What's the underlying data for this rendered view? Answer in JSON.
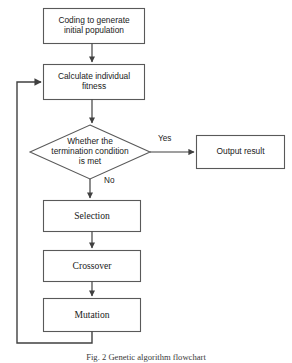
{
  "diagram": {
    "title": "Genetic algorithm flowchart",
    "colors": {
      "stroke": "#595959",
      "stroke_dark": "#404040",
      "text": "#1a1a1a",
      "background": "#ffffff"
    },
    "nodes": [
      {
        "id": "coding",
        "shape": "process",
        "label": "Coding to generate\ninitial population",
        "font": "sans"
      },
      {
        "id": "calculate",
        "shape": "process",
        "label": "Calculate individual\nfitness",
        "font": "sans"
      },
      {
        "id": "termination",
        "shape": "decision",
        "label": "Whether the\ntermination condition\nis met",
        "font": "sans"
      },
      {
        "id": "output",
        "shape": "process",
        "label": "Output result",
        "font": "sans"
      },
      {
        "id": "selection",
        "shape": "process",
        "label": "Selection",
        "font": "serif"
      },
      {
        "id": "crossover",
        "shape": "process",
        "label": "Crossover",
        "font": "serif"
      },
      {
        "id": "mutation",
        "shape": "process",
        "label": "Mutation",
        "font": "serif"
      }
    ],
    "edge_labels": {
      "yes": "Yes",
      "no": "No"
    },
    "caption": "Fig. 2  Genetic algorithm flowchart"
  }
}
